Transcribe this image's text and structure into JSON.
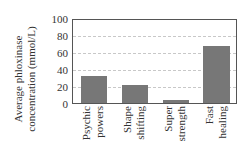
{
  "chart_data": {
    "type": "bar",
    "title": "",
    "xlabel": "",
    "ylabel": "Average phloxinase concentration (mmol/L)",
    "ylabel_lines": [
      "Average phloxinase",
      "concentration (mmol/L)"
    ],
    "categories": [
      "Psychic powers",
      "Shape shifting",
      "Super strength",
      "Fast healing"
    ],
    "category_lines": [
      [
        "Psychic",
        "powers"
      ],
      [
        "Shape",
        "shifting"
      ],
      [
        "Super",
        "strength"
      ],
      [
        "Fast",
        "healing"
      ]
    ],
    "values": [
      32,
      22,
      4,
      69
    ],
    "ylim": [
      0,
      100
    ],
    "yticks": [
      "100",
      "80",
      "60",
      "40",
      "20",
      "0"
    ],
    "grid": "horizontal dashed",
    "legend": "none",
    "bar_color": "#777777"
  }
}
